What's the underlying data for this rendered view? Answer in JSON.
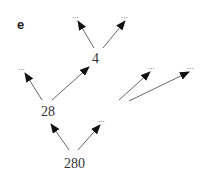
{
  "panel_label": "e",
  "nodes": {
    "n4": "4",
    "n28": "28",
    "n280": "280",
    "ellipsis": "..."
  },
  "diagram": {
    "type": "directed-tree",
    "edges": [
      {
        "from": "280",
        "to": "28"
      },
      {
        "from": "280",
        "to": "..."
      },
      {
        "from": "28",
        "to": "..."
      },
      {
        "from": "28",
        "to": "4"
      },
      {
        "from": "4",
        "to": "..."
      },
      {
        "from": "4",
        "to": "..."
      },
      {
        "from": "(unlabeled)",
        "to": "..."
      },
      {
        "from": "(unlabeled)",
        "to": "..."
      }
    ]
  },
  "colors": {
    "edge": "#555555",
    "arrowhead": "#111111",
    "text": "#333333"
  }
}
